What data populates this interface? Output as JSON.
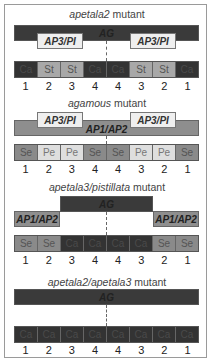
{
  "colors": {
    "Ca": "#333333",
    "St": "#a8a8a8",
    "Se": "#8a8a8a",
    "Pe": "#dedede",
    "AG": "#3a3a3a",
    "AP3_PI": "#efefef",
    "AP1_AP2": "#8e8e8e"
  },
  "panels": [
    {
      "title_italic": "apetala2",
      "title_rest": " mutant",
      "genes": {
        "ag": "AG",
        "ap3_left": "AP3/PI",
        "ap3_right": "AP3/PI"
      },
      "organs": [
        "Ca",
        "St",
        "St",
        "Ca",
        "Ca",
        "St",
        "St",
        "Ca"
      ],
      "whorls": [
        "1",
        "2",
        "3",
        "4",
        "4",
        "3",
        "2",
        "1"
      ]
    },
    {
      "title_italic": "agamous",
      "title_rest": " mutant",
      "genes": {
        "ap1": "AP1/AP2",
        "ap3_left": "AP3/PI",
        "ap3_right": "AP3/PI"
      },
      "organs": [
        "Se",
        "Pe",
        "Pe",
        "Se",
        "Se",
        "Pe",
        "Pe",
        "Se"
      ],
      "whorls": [
        "1",
        "2",
        "3",
        "4",
        "4",
        "3",
        "2",
        "1"
      ]
    },
    {
      "title_italic": "apetala3/pistillata",
      "title_rest": " mutant",
      "genes": {
        "ag": "AG",
        "ap1_left": "AP1/AP2",
        "ap1_right": "AP1/AP2"
      },
      "organs": [
        "Se",
        "Se",
        "Ca",
        "Ca",
        "Ca",
        "Ca",
        "Se",
        "Se"
      ],
      "whorls": [
        "1",
        "2",
        "3",
        "4",
        "4",
        "3",
        "2",
        "1"
      ]
    },
    {
      "title_italic": "apetala2/apetala3",
      "title_rest": " mutant",
      "genes": {
        "ag": "AG"
      },
      "organs": [
        "Ca",
        "Ca",
        "Ca",
        "Ca",
        "Ca",
        "Ca",
        "Ca",
        "Ca"
      ],
      "whorls": [
        "1",
        "2",
        "3",
        "4",
        "4",
        "3",
        "2",
        "1"
      ]
    }
  ]
}
